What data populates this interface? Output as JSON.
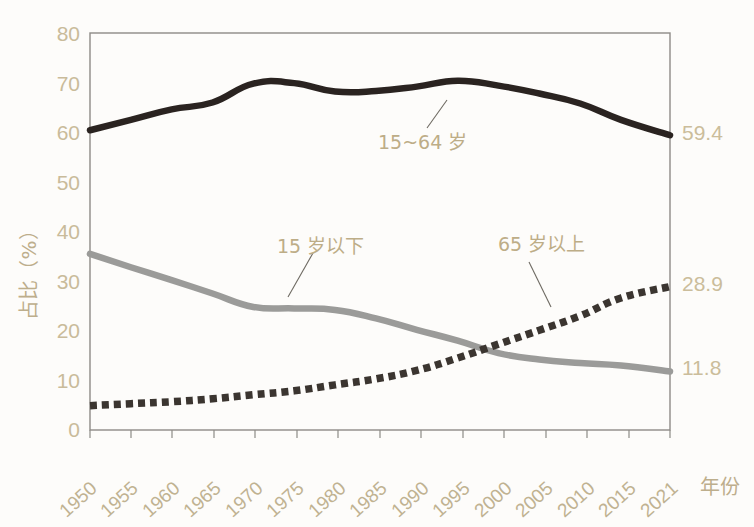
{
  "chart_data": {
    "type": "line",
    "title": "",
    "subtitle": "",
    "xlabel": "年份",
    "ylabel": "占比（%）",
    "xlim": [
      1950,
      2021
    ],
    "ylim": [
      0,
      80
    ],
    "ytick_labels": [
      "0",
      "10",
      "20",
      "30",
      "40",
      "50",
      "60",
      "70",
      "80"
    ],
    "ytick_values": [
      0,
      10,
      20,
      30,
      40,
      50,
      60,
      70,
      80
    ],
    "xtick_labels": [
      "1950",
      "1955",
      "1960",
      "1965",
      "1970",
      "1975",
      "1980",
      "1985",
      "1990",
      "1995",
      "2000",
      "2005",
      "2010",
      "2015",
      "2021"
    ],
    "xtick_values": [
      1950,
      1955,
      1960,
      1965,
      1970,
      1975,
      1980,
      1985,
      1990,
      1995,
      2000,
      2005,
      2010,
      2015,
      2021
    ],
    "grid": false,
    "legend_position": "inline-annotations",
    "x": [
      1950,
      1955,
      1960,
      1965,
      1970,
      1975,
      1980,
      1985,
      1990,
      1995,
      2000,
      2005,
      2010,
      2015,
      2021
    ],
    "series": [
      {
        "name": "15~64 岁",
        "style": "solid",
        "color": "#2a2320",
        "values": [
          60.4,
          62.5,
          64.6,
          66.0,
          69.8,
          69.9,
          68.2,
          68.3,
          69.2,
          70.4,
          69.4,
          67.8,
          65.8,
          62.5,
          59.4
        ],
        "end_label": "59.4"
      },
      {
        "name": "15 岁以下",
        "style": "solid",
        "color": "#9b9b99",
        "values": [
          35.5,
          32.8,
          30.2,
          27.5,
          24.8,
          24.5,
          24.2,
          22.5,
          20.2,
          18.0,
          15.5,
          14.2,
          13.5,
          13.0,
          11.8
        ],
        "end_label": "11.8"
      },
      {
        "name": "65 岁以上",
        "style": "dotted",
        "color": "#3b3530",
        "values": [
          4.9,
          5.3,
          5.7,
          6.3,
          7.1,
          7.9,
          9.1,
          10.3,
          12.0,
          14.5,
          17.3,
          20.1,
          23.0,
          26.6,
          28.9
        ],
        "end_label": "28.9"
      }
    ],
    "annotations": [
      {
        "text": "15~64 岁",
        "series": "15~64 岁"
      },
      {
        "text": "15 岁以下",
        "series": "15 岁以下"
      },
      {
        "text": "65 岁以上",
        "series": "65 岁以上"
      }
    ],
    "end_value_labels": [
      "59.4",
      "28.9",
      "11.8"
    ]
  },
  "colors": {
    "axis_text": "#c9bb9a",
    "frame": "#8d8b86",
    "series_dark": "#2a2320",
    "series_gray": "#9b9b99",
    "series_dotted": "#3b3530",
    "background": "#fdfcfa"
  }
}
